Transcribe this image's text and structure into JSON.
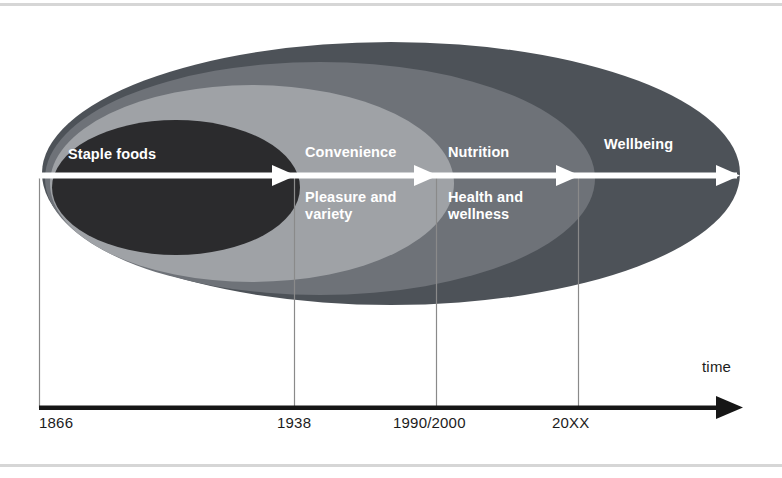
{
  "diagram": {
    "type": "nested-ellipse-timeline",
    "title_visible": false,
    "axis": {
      "name": "time",
      "ticks": [
        {
          "label": "1866",
          "x": 39
        },
        {
          "label": "1938",
          "x": 294
        },
        {
          "label": "1990/2000",
          "x": 436
        },
        {
          "label": "20XX",
          "x": 578
        }
      ]
    },
    "phases": [
      {
        "id": "staple-foods",
        "primary": "Staple foods",
        "secondary": "",
        "fill": "#2b2b2d",
        "start_label": "1866",
        "end_label": "1938"
      },
      {
        "id": "convenience",
        "primary": "Convenience",
        "secondary": "Pleasure and\nvariety",
        "fill": "#9fa2a6",
        "start_label": "1938",
        "end_label": "1990/2000"
      },
      {
        "id": "nutrition",
        "primary": "Nutrition",
        "secondary": "Health and\nwellness",
        "fill": "#6e7278",
        "start_label": "1990/2000",
        "end_label": "20XX"
      },
      {
        "id": "wellbeing",
        "primary": "Wellbeing",
        "secondary": "",
        "fill": "#4d5258",
        "start_label": "20XX",
        "end_label": ""
      }
    ],
    "colors": {
      "ellipse_outer": "#4d5258",
      "ellipse_third": "#6e7278",
      "ellipse_second": "#9fa2a6",
      "ellipse_inner": "#2b2b2d",
      "arrow_white": "#ffffff",
      "axis_black": "#161616",
      "tick_line": "#8a8a8a",
      "rule_gray": "#d6d6d6",
      "label_text": "#ffffff"
    }
  }
}
